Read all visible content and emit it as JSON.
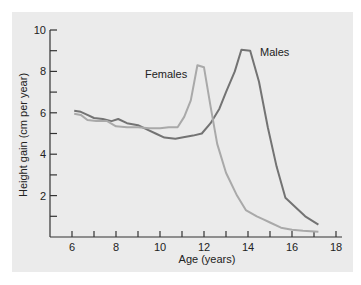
{
  "chart_data": {
    "type": "line",
    "title": "",
    "xlabel": "Age (years)",
    "ylabel": "Height gain (cm per year)",
    "xlim": [
      5,
      18.2
    ],
    "ylim": [
      0,
      10
    ],
    "x_ticks": [
      6,
      7,
      8,
      9,
      10,
      11,
      12,
      13,
      14,
      15,
      16,
      17,
      18
    ],
    "x_tick_labels": [
      "6",
      "",
      "8",
      "",
      "10",
      "",
      "12",
      "",
      "14",
      "",
      "16",
      "",
      "18"
    ],
    "y_ticks": [
      1,
      2,
      3,
      4,
      5,
      6,
      7,
      8,
      9,
      10
    ],
    "y_tick_labels": [
      "",
      "2",
      "",
      "4",
      "",
      "6",
      "",
      "8",
      "",
      "10"
    ],
    "grid": false,
    "legend": "inline labels",
    "series": [
      {
        "name": "Males",
        "color": "#737373",
        "label_pos": {
          "x": 260,
          "y": 56
        },
        "x": [
          6.1,
          6.4,
          6.7,
          7.0,
          7.4,
          7.8,
          8.1,
          8.5,
          9.0,
          9.4,
          9.8,
          10.2,
          10.7,
          11.0,
          11.5,
          11.9,
          12.3,
          12.7,
          13.0,
          13.4,
          13.7,
          14.1,
          14.5,
          14.9,
          15.3,
          15.7,
          16.1,
          16.6,
          17.2
        ],
        "values": [
          6.1,
          6.05,
          5.9,
          5.75,
          5.7,
          5.6,
          5.7,
          5.5,
          5.4,
          5.2,
          5.0,
          4.8,
          4.75,
          4.8,
          4.9,
          5.0,
          5.5,
          6.2,
          7.0,
          8.0,
          9.05,
          9.0,
          7.5,
          5.3,
          3.4,
          1.9,
          1.5,
          1.0,
          0.6
        ]
      },
      {
        "name": "Females",
        "color": "#a9a9a9",
        "label_pos": {
          "x": 145,
          "y": 78
        },
        "x": [
          6.1,
          6.4,
          6.7,
          7.1,
          7.6,
          8.0,
          8.5,
          9.0,
          9.5,
          10.0,
          10.4,
          10.8,
          11.1,
          11.4,
          11.7,
          12.0,
          12.3,
          12.6,
          13.0,
          13.5,
          13.9,
          14.4,
          14.7,
          15.0,
          15.5,
          16.0,
          16.5,
          17.2
        ],
        "values": [
          5.95,
          5.9,
          5.65,
          5.6,
          5.6,
          5.35,
          5.3,
          5.3,
          5.25,
          5.25,
          5.3,
          5.3,
          5.8,
          6.6,
          8.3,
          8.2,
          6.3,
          4.5,
          3.1,
          2.0,
          1.3,
          1.0,
          0.85,
          0.7,
          0.45,
          0.35,
          0.3,
          0.25
        ]
      }
    ]
  }
}
